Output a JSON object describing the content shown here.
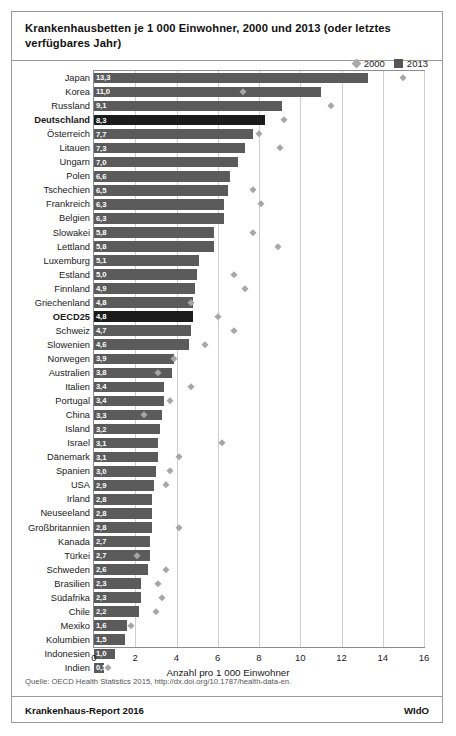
{
  "header": {
    "title": "Krankenhausbetten je 1 000 Einwohner, 2000 und 2013  (oder letztes verfügbares Jahr)"
  },
  "legend": {
    "items": [
      {
        "label": "2000",
        "marker": "diamond",
        "color": "#a8a8a8"
      },
      {
        "label": "2013",
        "marker": "square",
        "color": "#565656"
      }
    ]
  },
  "footer": {
    "source": "Quelle: OECD Health Statistics 2015, http://dx.doi.org/10.1787/health-data-en.",
    "report": "Krankenhaus-Report 2016",
    "publisher": "WIdO"
  },
  "colors": {
    "bar_2013": "#5b5b5b",
    "bar_highlight": "#1b1b1b",
    "marker_2000": "#a6a6a6",
    "grid": "#cfcfcf",
    "border": "#9a9a9a"
  },
  "chart_data": {
    "type": "bar",
    "orientation": "horizontal",
    "title": "Krankenhausbetten je 1 000 Einwohner, 2000 und 2013  (oder letztes verfügbares Jahr)",
    "xlabel": "Anzahl pro 1 000 Einwohner",
    "ylabel": "",
    "xlim": [
      0,
      16
    ],
    "xticks": [
      0,
      2,
      4,
      6,
      8,
      10,
      12,
      14,
      16
    ],
    "grid": true,
    "legend_position": "top-right",
    "decimal_separator": ",",
    "categories": [
      "Japan",
      "Korea",
      "Russland",
      "Deutschland",
      "Österreich",
      "Litauen",
      "Ungarn",
      "Polen",
      "Tschechien",
      "Frankreich",
      "Belgien",
      "Slowakei",
      "Lettland",
      "Luxemburg",
      "Estland",
      "Finnland",
      "Griechenland",
      "OECD25",
      "Schweiz",
      "Slowenien",
      "Norwegen",
      "Australien",
      "Italien",
      "Portugal",
      "China",
      "Island",
      "Israel",
      "Dänemark",
      "Spanien",
      "USA",
      "Irland",
      "Neuseeland",
      "Großbritannien",
      "Kanada",
      "Türkei",
      "Schweden",
      "Brasilien",
      "Südafrika",
      "Chile",
      "Mexiko",
      "Kolumbien",
      "Indonesien",
      "Indien"
    ],
    "highlighted": [
      "Deutschland",
      "OECD25"
    ],
    "series": [
      {
        "name": "2013",
        "type": "bar",
        "labels": [
          "13,3",
          "11,0",
          "9,1",
          "8,3",
          "7,7",
          "7,3",
          "7,0",
          "6,6",
          "6,5",
          "6,3",
          "6,3",
          "5,8",
          "5,8",
          "5,1",
          "5,0",
          "4,9",
          "4,8",
          "4,8",
          "4,7",
          "4,6",
          "3,9",
          "3,8",
          "3,4",
          "3,4",
          "3,3",
          "3,2",
          "3,1",
          "3,1",
          "3,0",
          "2,9",
          "2,8",
          "2,8",
          "2,8",
          "2,7",
          "2,7",
          "2,6",
          "2,3",
          "2,3",
          "2,2",
          "1,6",
          "1,5",
          "1,0",
          "0,5"
        ],
        "values": [
          13.3,
          11.0,
          9.1,
          8.3,
          7.7,
          7.3,
          7.0,
          6.6,
          6.5,
          6.3,
          6.3,
          5.8,
          5.8,
          5.1,
          5.0,
          4.9,
          4.8,
          4.8,
          4.7,
          4.6,
          3.9,
          3.8,
          3.4,
          3.4,
          3.3,
          3.2,
          3.1,
          3.1,
          3.0,
          2.9,
          2.8,
          2.8,
          2.8,
          2.7,
          2.7,
          2.6,
          2.3,
          2.3,
          2.2,
          1.6,
          1.5,
          1.0,
          0.5
        ]
      },
      {
        "name": "2000",
        "type": "scatter",
        "values": [
          15.0,
          7.2,
          11.5,
          9.2,
          8.0,
          9.0,
          null,
          null,
          7.7,
          8.1,
          null,
          7.7,
          8.9,
          null,
          6.8,
          7.3,
          4.7,
          6.0,
          6.8,
          5.4,
          3.9,
          3.1,
          4.7,
          3.7,
          2.4,
          null,
          6.2,
          4.1,
          3.7,
          3.5,
          null,
          null,
          4.1,
          null,
          2.1,
          3.5,
          3.1,
          3.3,
          3.0,
          1.8,
          null,
          null,
          0.7
        ]
      }
    ]
  }
}
